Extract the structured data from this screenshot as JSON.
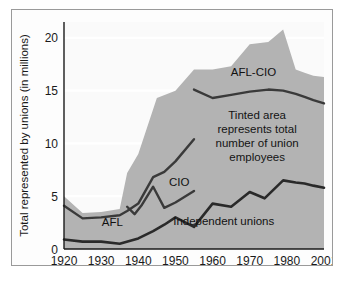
{
  "chart_data": {
    "type": "area",
    "title": "",
    "subtitle": "",
    "xlabel": "",
    "ylabel": "Total represented by unions (in millions)",
    "xlim": [
      1920,
      2001
    ],
    "ylim": [
      0,
      21.5
    ],
    "yticks": [
      0,
      5,
      10,
      15,
      20
    ],
    "ytick_labels": [
      "0",
      "5",
      "10",
      "15",
      "20"
    ],
    "xticks": [
      1920,
      1930,
      1940,
      1950,
      1960,
      1970,
      1980,
      2001
    ],
    "xtick_labels": [
      "1920",
      "1930",
      "1940",
      "1950",
      "1960",
      "1970",
      "1980",
      "2001"
    ],
    "grid": true,
    "legend_position": "inline-annotations",
    "series": [
      {
        "name": "Total union employees (tinted area)",
        "kind": "area",
        "color": "#b3b3b3",
        "x": [
          1920,
          1925,
          1930,
          1935,
          1937,
          1940,
          1945,
          1950,
          1955,
          1960,
          1965,
          1970,
          1975,
          1979,
          1985,
          1990,
          1995,
          2001
        ],
        "values": [
          5.0,
          3.4,
          3.5,
          3.8,
          7.2,
          9.0,
          14.3,
          15.0,
          17.0,
          17.0,
          17.3,
          19.4,
          19.6,
          20.8,
          17.0,
          16.7,
          16.4,
          16.3
        ]
      },
      {
        "name": "AFL",
        "kind": "line",
        "color": "#3a3a3a",
        "x": [
          1920,
          1925,
          1930,
          1935,
          1937,
          1940,
          1944,
          1947,
          1950,
          1955
        ],
        "values": [
          4.1,
          2.9,
          3.0,
          3.2,
          3.6,
          4.3,
          6.8,
          7.3,
          8.3,
          10.4
        ]
      },
      {
        "name": "CIO",
        "kind": "line",
        "color": "#3a3a3a",
        "x": [
          1937,
          1939,
          1941,
          1944,
          1947,
          1950,
          1955
        ],
        "values": [
          4.0,
          3.3,
          4.2,
          5.9,
          3.9,
          4.4,
          5.5
        ]
      },
      {
        "name": "AFL-CIO",
        "kind": "line",
        "color": "#3a3a3a",
        "x": [
          1955,
          1960,
          1965,
          1970,
          1975,
          1979,
          1985,
          1990,
          1995,
          2001
        ],
        "values": [
          15.1,
          14.3,
          14.6,
          14.9,
          15.1,
          15.0,
          14.7,
          14.4,
          14.1,
          13.8
        ]
      },
      {
        "name": "Independent unions",
        "kind": "line",
        "color": "#2a2a2a",
        "x": [
          1920,
          1925,
          1930,
          1935,
          1940,
          1944,
          1947,
          1950,
          1955,
          1960,
          1965,
          1970,
          1974,
          1979,
          1985,
          1990,
          1995,
          2001
        ],
        "values": [
          0.9,
          0.7,
          0.7,
          0.5,
          1.0,
          1.7,
          2.3,
          3.0,
          2.1,
          4.3,
          4.0,
          5.4,
          4.8,
          6.5,
          6.3,
          6.2,
          6.0,
          5.8
        ]
      }
    ],
    "annotations": [
      {
        "id": "afl-cio-label",
        "text": "AFL-CIO",
        "x": 1971,
        "y": 16.4
      },
      {
        "id": "afl-label",
        "text": "AFL",
        "x": 1933,
        "y": 2.2
      },
      {
        "id": "cio-label",
        "text": "CIO",
        "x": 1951,
        "y": 6.0
      },
      {
        "id": "independent-label",
        "text": "Independent unions",
        "x": 1963,
        "y": 2.3
      },
      {
        "id": "tinted-note",
        "lines": [
          "Tinted area",
          "represents total",
          "number of union",
          "employees"
        ],
        "x": 1972,
        "y": 12.3
      }
    ],
    "colors": {
      "area_fill": "#b3b3b3",
      "plot_background": "#fafafa",
      "gridline": "#ffffff",
      "axis_line": "#1a1a1a",
      "line_dark": "#2f2f2f",
      "frame_border": "#9a9a9a"
    }
  }
}
